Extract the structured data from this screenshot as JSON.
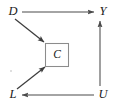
{
  "figure": {
    "background_color": "#ffffff",
    "width": 114,
    "height": 110
  },
  "nodes": [
    {
      "id": "D",
      "label": "D",
      "x": 13,
      "y": 12,
      "boxed": false
    },
    {
      "id": "Y",
      "label": "Y",
      "x": 103,
      "y": 12,
      "boxed": false
    },
    {
      "id": "C",
      "label": "C",
      "x": 57,
      "y": 55,
      "boxed": true
    },
    {
      "id": "L",
      "label": "L",
      "x": 13,
      "y": 95,
      "boxed": false
    },
    {
      "id": "U",
      "label": "U",
      "x": 103,
      "y": 95,
      "boxed": false
    }
  ],
  "edges": [
    {
      "id": "D-Y",
      "from": "D",
      "to": "Y",
      "style": "straight",
      "arrow": "to"
    },
    {
      "id": "D-C",
      "from": "D",
      "to": "C",
      "style": "diagonal",
      "arrow": "to"
    },
    {
      "id": "L-C",
      "from": "L",
      "to": "C",
      "style": "diagonal",
      "arrow": "to"
    },
    {
      "id": "U-L",
      "from": "U",
      "to": "L",
      "style": "straight",
      "arrow": "to"
    },
    {
      "id": "U-Y",
      "from": "U",
      "to": "Y",
      "style": "straight",
      "arrow": "to"
    }
  ],
  "collider_box": {
    "node": "C",
    "x": 45,
    "y": 43,
    "width": 24,
    "height": 24,
    "stroke_color": "#8c8c8c"
  },
  "colors": {
    "edge": "#4a4a4a",
    "edge_diagonal": "#3d3d3d",
    "label": "#1a1a1a",
    "box_stroke": "#8c8c8c",
    "background": "#ffffff"
  }
}
